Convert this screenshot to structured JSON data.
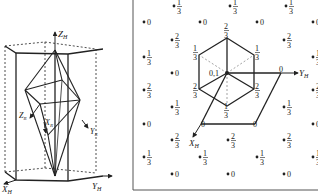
{
  "left_figure": {
    "axes": {
      "z": "Z",
      "z_sub": "H",
      "x": "X",
      "x_sub": "H",
      "y": "Y",
      "y_sub": "H",
      "z_r": "Z",
      "z_r_sub": "R",
      "x_r": "X",
      "x_r_sub": "R",
      "y_r": "Y",
      "y_r_sub": "R"
    }
  },
  "right_figure": {
    "axes": {
      "y": "Y",
      "y_sub": "H",
      "x": "X",
      "x_sub": "H"
    },
    "center_label": "0,1",
    "grid_points": [
      {
        "x": 174,
        "y": 6,
        "label": "1/3"
      },
      {
        "x": 230,
        "y": 6,
        "label": "1/3"
      },
      {
        "x": 286,
        "y": 6,
        "label": "1/3"
      },
      {
        "x": 144,
        "y": 22,
        "label": "0"
      },
      {
        "x": 200,
        "y": 22,
        "label": "0"
      },
      {
        "x": 257,
        "y": 22,
        "label": "0"
      },
      {
        "x": 313,
        "y": 22,
        "label": "0"
      },
      {
        "x": 172,
        "y": 40,
        "label": "2/3"
      },
      {
        "x": 284,
        "y": 40,
        "label": "2/3"
      },
      {
        "x": 144,
        "y": 57,
        "label": "1/3"
      },
      {
        "x": 313,
        "y": 57,
        "label": "1/3"
      },
      {
        "x": 172,
        "y": 73,
        "label": "0"
      },
      {
        "x": 144,
        "y": 90,
        "label": "2/3"
      },
      {
        "x": 313,
        "y": 90,
        "label": "2/3"
      },
      {
        "x": 172,
        "y": 107,
        "label": "1/3"
      },
      {
        "x": 284,
        "y": 107,
        "label": "1/3"
      },
      {
        "x": 144,
        "y": 124,
        "label": "0"
      },
      {
        "x": 313,
        "y": 124,
        "label": "0"
      },
      {
        "x": 172,
        "y": 140,
        "label": "2/3"
      },
      {
        "x": 228,
        "y": 140,
        "label": "2/3"
      },
      {
        "x": 284,
        "y": 140,
        "label": "2/3"
      },
      {
        "x": 144,
        "y": 157,
        "label": "1/3"
      },
      {
        "x": 200,
        "y": 157,
        "label": "1/3"
      },
      {
        "x": 257,
        "y": 157,
        "label": "1/3"
      },
      {
        "x": 313,
        "y": 157,
        "label": "1/3"
      },
      {
        "x": 172,
        "y": 174,
        "label": "0"
      },
      {
        "x": 228,
        "y": 174,
        "label": "0"
      },
      {
        "x": 284,
        "y": 174,
        "label": "0"
      }
    ],
    "hexagon_labels": [
      {
        "x": 227,
        "y": 30,
        "label": "2/3"
      },
      {
        "x": 196,
        "y": 52,
        "label": "1/3"
      },
      {
        "x": 258,
        "y": 52,
        "label": "1/3"
      },
      {
        "x": 196,
        "y": 90,
        "label": "2/3"
      },
      {
        "x": 258,
        "y": 90,
        "label": "2/3"
      },
      {
        "x": 227,
        "y": 110,
        "label": "1/3"
      }
    ],
    "parallelogram_labels": [
      {
        "x": 204,
        "y": 124,
        "label": "0"
      },
      {
        "x": 256,
        "y": 124,
        "label": "0"
      },
      {
        "x": 282,
        "y": 69,
        "label": "0"
      }
    ]
  }
}
